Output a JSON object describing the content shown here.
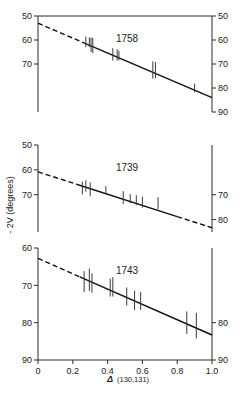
{
  "figure": {
    "background": "#ffffff",
    "line_color": "#111111",
    "axis_color": "#2b2b2b",
    "marker_color": "#3a3a3a"
  },
  "axis_titles": {
    "ylabel": "- 2V  (degrees)",
    "xlabel_symbol": "Δ",
    "xlabel_sub": "(130,131)"
  },
  "xaxis": {
    "min": 0,
    "max": 1.0,
    "ticks": [
      0,
      0.2,
      0.4,
      0.6,
      0.8,
      1.0
    ],
    "tick_labels": [
      "0",
      "0.2",
      "0.4",
      "0.6",
      "0.8",
      "1.0"
    ]
  },
  "chart_data": {
    "type": "scatter",
    "title": "",
    "xlabel": "Δ (130,131)",
    "ylabel": "- 2V (degrees)",
    "xlim": [
      0,
      1.0
    ],
    "grid": false,
    "legend": "none",
    "y_inverted": true,
    "note": "Three stacked panels; each shows -2V (degrees) versus Delta(130,131) with vertical error bars and a linear regression line (dashed where extrapolated beyond the data range).",
    "panels": [
      {
        "name": "1758",
        "label": "1758",
        "ylim": [
          50,
          90
        ],
        "left_axis_ticks": [
          50,
          60,
          70
        ],
        "left_axis_tick_labels": [
          "50",
          "60",
          "70"
        ],
        "right_axis_ticks": [
          50,
          60,
          70,
          80,
          90
        ],
        "right_axis_tick_labels": [
          "50",
          "60",
          "70",
          "80",
          "90"
        ],
        "fit": {
          "intercept": 53.0,
          "slope": 31.0,
          "dashed_to_x": 0.27
        },
        "points": [
          {
            "x": 0.275,
            "y": 60.8,
            "yerr": 2.2
          },
          {
            "x": 0.295,
            "y": 61.0,
            "yerr": 2.0
          },
          {
            "x": 0.305,
            "y": 62.0,
            "yerr": 3.0
          },
          {
            "x": 0.315,
            "y": 62.3,
            "yerr": 3.2
          },
          {
            "x": 0.43,
            "y": 66.0,
            "yerr": 2.6
          },
          {
            "x": 0.455,
            "y": 66.2,
            "yerr": 2.4
          },
          {
            "x": 0.465,
            "y": 66.5,
            "yerr": 2.0
          },
          {
            "x": 0.66,
            "y": 72.5,
            "yerr": 3.6
          },
          {
            "x": 0.675,
            "y": 72.6,
            "yerr": 3.4
          },
          {
            "x": 0.9,
            "y": 80.0,
            "yerr": 1.8
          }
        ]
      },
      {
        "name": "1739",
        "label": "1739",
        "ylim": [
          50,
          85
        ],
        "left_axis_ticks": [
          50,
          60,
          70
        ],
        "left_axis_tick_labels": [
          "50",
          "60",
          "70"
        ],
        "right_axis_ticks": [
          70,
          80
        ],
        "right_axis_tick_labels": [
          "70",
          "80"
        ],
        "fit": {
          "intercept": 60.8,
          "slope": 22.5,
          "dashed_to_x": 0.23,
          "dashed_from_x": 0.8
        },
        "points": [
          {
            "x": 0.255,
            "y": 67.3,
            "yerr": 2.6
          },
          {
            "x": 0.275,
            "y": 66.5,
            "yerr": 2.3
          },
          {
            "x": 0.3,
            "y": 67.8,
            "yerr": 2.8
          },
          {
            "x": 0.39,
            "y": 68.2,
            "yerr": 1.7
          },
          {
            "x": 0.49,
            "y": 71.2,
            "yerr": 2.6
          },
          {
            "x": 0.53,
            "y": 71.6,
            "yerr": 1.8
          },
          {
            "x": 0.565,
            "y": 72.2,
            "yerr": 2.0
          },
          {
            "x": 0.6,
            "y": 73.0,
            "yerr": 2.2
          },
          {
            "x": 0.69,
            "y": 73.4,
            "yerr": 2.4
          }
        ]
      },
      {
        "name": "1743",
        "label": "1743",
        "ylim": [
          60,
          90
        ],
        "left_axis_ticks": [
          60,
          70,
          80,
          90
        ],
        "left_axis_tick_labels": [
          "60",
          "70",
          "80",
          "90"
        ],
        "right_axis_ticks": [
          80,
          90
        ],
        "right_axis_tick_labels": [
          "80",
          "90"
        ],
        "fit": {
          "intercept": 62.8,
          "slope": 20.5,
          "dashed_to_x": 0.24
        },
        "points": [
          {
            "x": 0.265,
            "y": 69.0,
            "yerr": 2.8
          },
          {
            "x": 0.295,
            "y": 68.5,
            "yerr": 3.0
          },
          {
            "x": 0.31,
            "y": 69.4,
            "yerr": 2.6
          },
          {
            "x": 0.415,
            "y": 70.6,
            "yerr": 2.4
          },
          {
            "x": 0.43,
            "y": 70.4,
            "yerr": 2.6
          },
          {
            "x": 0.51,
            "y": 73.0,
            "yerr": 2.4
          },
          {
            "x": 0.555,
            "y": 74.0,
            "yerr": 2.6
          },
          {
            "x": 0.59,
            "y": 74.2,
            "yerr": 2.4
          },
          {
            "x": 0.855,
            "y": 80.0,
            "yerr": 3.0
          },
          {
            "x": 0.91,
            "y": 80.8,
            "yerr": 3.4
          }
        ]
      }
    ]
  }
}
